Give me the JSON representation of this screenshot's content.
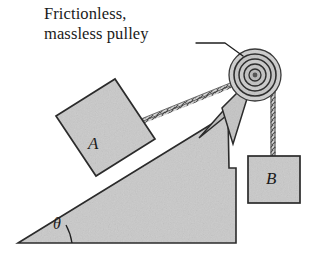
{
  "figure": {
    "caption": "Frictionless,\nmassless pulley",
    "caption_lines": [
      "Frictionless,",
      "massless pulley"
    ],
    "labels": {
      "block_a": "A",
      "block_b": "B",
      "angle": "θ"
    },
    "colors": {
      "fill_gray": "#c9c9c9",
      "fill_gray_light": "#d2d2d2",
      "outline": "#2b2b2b",
      "rope": "#4a4a4a",
      "background": "#ffffff",
      "text": "#1a1a1a"
    },
    "elements": {
      "incline": "inclined-plane-wedge",
      "block_a": "block-a-on-incline",
      "block_b": "block-b-hanging",
      "pulley": "frictionless-massless-pulley",
      "bracket": "pulley-support-bracket",
      "rope_incline": "rope-block-a-to-pulley",
      "rope_hanging": "rope-pulley-to-block-b",
      "angle_arc": "incline-angle-arc",
      "leader": "caption-leader-line"
    }
  }
}
